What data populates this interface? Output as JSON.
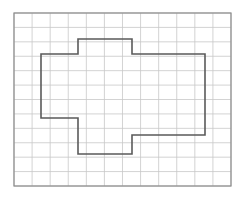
{
  "figure": {
    "kind": "grid-polygon-worksheet",
    "canvas": {
      "width": 243,
      "height": 200,
      "background": "#ffffff"
    },
    "grid": {
      "name": "square-grid",
      "origin_x": 14,
      "origin_y": 13,
      "cols": 12,
      "rows": 12,
      "cell_width": 18.083,
      "cell_height": 14.417,
      "line_color": "#c8c8c8",
      "line_width": 0.8,
      "border_color": "#8c8c8c",
      "border_width": 1.2,
      "fill": "#ffffff"
    },
    "polygon": {
      "name": "irregular-polygon",
      "stroke_color": "#5a5a5a",
      "stroke_width": 1.6,
      "fill": "none",
      "closed": true,
      "vertices_grid": [
        [
          1.5,
          2.85
        ],
        [
          3.5,
          2.85
        ],
        [
          3.5,
          1.85
        ],
        [
          6.5,
          1.85
        ],
        [
          6.5,
          2.85
        ],
        [
          10.55,
          2.85
        ],
        [
          10.55,
          8.45
        ],
        [
          6.5,
          8.45
        ],
        [
          6.5,
          9.75
        ],
        [
          3.5,
          9.75
        ],
        [
          3.5,
          7.3
        ],
        [
          1.5,
          7.3
        ]
      ],
      "vertices_px": [
        [
          41,
          54
        ],
        [
          78,
          54
        ],
        [
          78,
          39
        ],
        [
          132,
          39
        ],
        [
          132,
          54
        ],
        [
          205,
          54
        ],
        [
          205,
          135
        ],
        [
          132,
          135
        ],
        [
          132,
          154
        ],
        [
          78,
          154
        ],
        [
          78,
          118
        ],
        [
          41,
          118
        ]
      ]
    }
  }
}
